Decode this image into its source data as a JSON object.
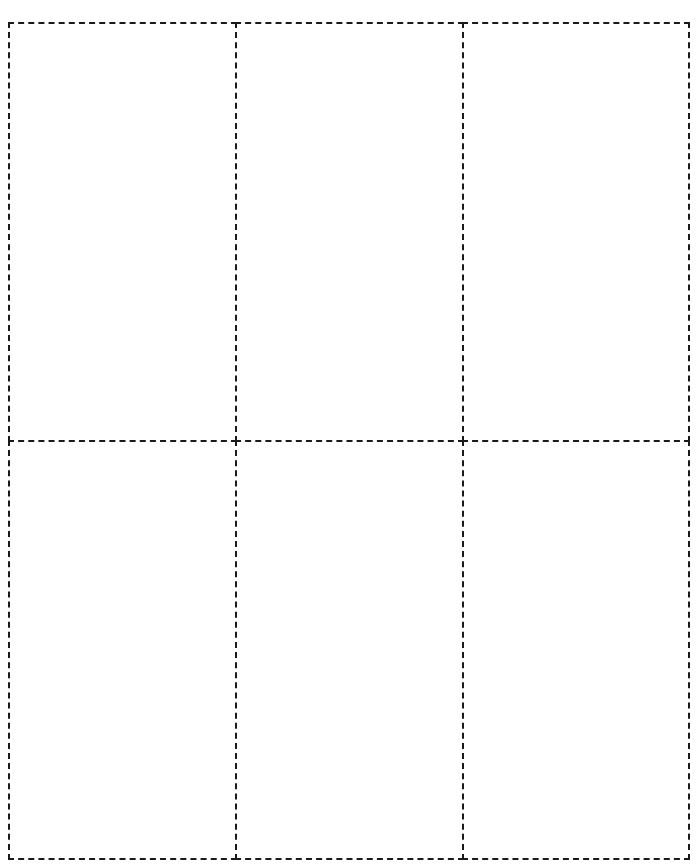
{
  "page": {
    "title_visible": false,
    "title": ""
  },
  "template": {
    "type": "printable cut-out card sheet",
    "columns": 3,
    "rows": 2,
    "border_style": "dashed",
    "border_color": "#1a1a1a",
    "background": "#ffffff",
    "cards": [
      {
        "row": 1,
        "col": 1,
        "content": ""
      },
      {
        "row": 1,
        "col": 2,
        "content": ""
      },
      {
        "row": 1,
        "col": 3,
        "content": ""
      },
      {
        "row": 2,
        "col": 1,
        "content": ""
      },
      {
        "row": 2,
        "col": 2,
        "content": ""
      },
      {
        "row": 2,
        "col": 3,
        "content": ""
      }
    ]
  }
}
